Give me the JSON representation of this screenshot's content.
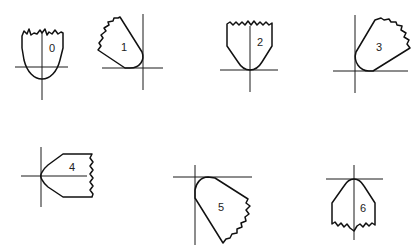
{
  "figure": {
    "stroke_color": "#111111",
    "background_color": "#ffffff",
    "shapes": [
      {
        "id": 0,
        "label": "0",
        "orientation": "tip pointing down, centered on vertical axis"
      },
      {
        "id": 1,
        "label": "1",
        "orientation": "tip pointing down-right toward axis corner"
      },
      {
        "id": 2,
        "label": "2",
        "orientation": "tip pointing down, centered on vertical axis"
      },
      {
        "id": 3,
        "label": "3",
        "orientation": "tip pointing down-left toward axis corner"
      },
      {
        "id": 4,
        "label": "4",
        "orientation": "tip pointing left, centered on horizontal axis"
      },
      {
        "id": 5,
        "label": "5",
        "orientation": "tip pointing up-left toward axis corner"
      },
      {
        "id": 6,
        "label": "6",
        "orientation": "tip pointing up, centered on vertical axis"
      }
    ]
  }
}
